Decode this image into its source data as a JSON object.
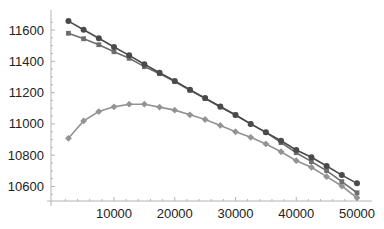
{
  "chart_data": {
    "type": "line",
    "title": "",
    "xlabel": "",
    "ylabel": "",
    "xlim": [
      0,
      51000
    ],
    "ylim": [
      10500,
      11700
    ],
    "grid": false,
    "legend": null,
    "x_ticks": [
      10000,
      20000,
      30000,
      40000,
      50000
    ],
    "x_tick_labels": [
      "10000",
      "20000",
      "30000",
      "40000",
      "50000"
    ],
    "y_ticks": [
      10600,
      10800,
      11000,
      11200,
      11400,
      11600
    ],
    "y_tick_labels": [
      "10600",
      "10800",
      "11000",
      "11200",
      "11400",
      "11600"
    ],
    "x": [
      2500,
      5000,
      7500,
      10000,
      12500,
      15000,
      17500,
      20000,
      22500,
      25000,
      27500,
      30000,
      32500,
      35000,
      37500,
      40000,
      42500,
      45000,
      47500,
      50000
    ],
    "series": [
      {
        "name": "series-circle",
        "marker": "circle",
        "color": "#4a4a4a",
        "values": [
          11657,
          11602,
          11547,
          11491,
          11438,
          11381,
          11327,
          11274,
          11219,
          11165,
          11111,
          11057,
          11000,
          10946,
          10892,
          10833,
          10787,
          10731,
          10673,
          10620
        ]
      },
      {
        "name": "series-square",
        "marker": "square",
        "color": "#6e6e6e",
        "values": [
          11579,
          11544,
          11506,
          11461,
          11419,
          11366,
          11321,
          11270,
          11215,
          11162,
          11108,
          11057,
          11000,
          10946,
          10880,
          10816,
          10759,
          10701,
          10631,
          10560
        ]
      },
      {
        "name": "series-diamond",
        "marker": "diamond",
        "color": "#939393",
        "values": [
          10908,
          11019,
          11079,
          11109,
          11126,
          11126,
          11107,
          11088,
          11058,
          11028,
          10990,
          10950,
          10914,
          10872,
          10822,
          10765,
          10723,
          10663,
          10603,
          10528
        ]
      }
    ]
  },
  "axes_color": "#b4b4b4"
}
